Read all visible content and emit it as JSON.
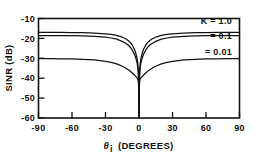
{
  "chart_data": {
    "type": "line",
    "title": "",
    "xlabel": "θᵢ (DEGREES)",
    "ylabel": "SINR (dB)",
    "xlim": [
      -90,
      90
    ],
    "ylim": [
      -60,
      -10
    ],
    "grid": false,
    "legend_position": "inside-right",
    "xticks": [
      -90,
      -60,
      -30,
      0,
      30,
      60,
      90
    ],
    "xticklabels": [
      "-90",
      "-60",
      "-30",
      "0",
      "30",
      "60",
      "90"
    ],
    "yticks": [
      -10,
      -20,
      -30,
      -40,
      -50,
      -60
    ],
    "yticklabels": [
      "-10",
      "-20",
      "-30",
      "-40",
      "-50",
      "-60"
    ],
    "series": [
      {
        "name": "K = 1.0",
        "label": "K = 1.0",
        "plateau_db": -17.0,
        "null_db": -60,
        "x": [
          -90,
          -80,
          -70,
          -60,
          -50,
          -40,
          -30,
          -25,
          -20,
          -15,
          -12,
          -10,
          -8,
          -6,
          -4,
          -3,
          -2,
          -1.2,
          -0.6,
          -0.25,
          0,
          0.25,
          0.6,
          1.2,
          2,
          3,
          4,
          6,
          8,
          10,
          12,
          15,
          20,
          25,
          30,
          40,
          50,
          60,
          70,
          80,
          90
        ],
        "y": [
          -17.0,
          -17.0,
          -17.0,
          -17.05,
          -17.15,
          -17.3,
          -17.7,
          -18.0,
          -18.5,
          -19.4,
          -20.2,
          -20.9,
          -21.9,
          -23.4,
          -25.6,
          -27.2,
          -29.4,
          -32.0,
          -36.0,
          -41.5,
          -60.0,
          -41.5,
          -36.0,
          -32.0,
          -29.4,
          -27.2,
          -25.6,
          -23.4,
          -21.9,
          -20.9,
          -20.2,
          -19.4,
          -18.5,
          -18.0,
          -17.7,
          -17.3,
          -17.15,
          -17.05,
          -17.0,
          -17.0,
          -17.0
        ]
      },
      {
        "name": "= 0.1",
        "label": "= 0.1",
        "plateau_db": -18.6,
        "null_db": -60,
        "x": [
          -90,
          -80,
          -70,
          -60,
          -50,
          -40,
          -30,
          -25,
          -20,
          -15,
          -12,
          -10,
          -8,
          -6,
          -4,
          -3,
          -2,
          -1.2,
          -0.6,
          -0.25,
          0,
          0.25,
          0.6,
          1.2,
          2,
          3,
          4,
          6,
          8,
          10,
          12,
          15,
          20,
          25,
          30,
          40,
          50,
          60,
          70,
          80,
          90
        ],
        "y": [
          -18.6,
          -18.6,
          -18.6,
          -18.65,
          -18.75,
          -18.95,
          -19.4,
          -19.8,
          -20.4,
          -21.5,
          -22.4,
          -23.2,
          -24.3,
          -25.9,
          -28.1,
          -29.6,
          -31.6,
          -34.0,
          -37.6,
          -42.5,
          -60.0,
          -42.5,
          -37.6,
          -34.0,
          -31.6,
          -29.6,
          -28.1,
          -25.9,
          -24.3,
          -23.2,
          -22.4,
          -21.5,
          -20.4,
          -19.8,
          -19.4,
          -18.95,
          -18.75,
          -18.65,
          -18.6,
          -18.6,
          -18.6
        ]
      },
      {
        "name": "= 0.01",
        "label": "= 0.01",
        "plateau_db": -30.2,
        "null_db": -60,
        "x": [
          -90,
          -80,
          -70,
          -60,
          -50,
          -40,
          -30,
          -25,
          -20,
          -15,
          -12,
          -10,
          -8,
          -6,
          -4,
          -3,
          -2,
          -1.2,
          -0.6,
          -0.25,
          0,
          0.25,
          0.6,
          1.2,
          2,
          3,
          4,
          6,
          8,
          10,
          12,
          15,
          20,
          25,
          30,
          40,
          50,
          60,
          70,
          80,
          90
        ],
        "y": [
          -30.2,
          -30.2,
          -30.25,
          -30.3,
          -30.5,
          -30.8,
          -31.5,
          -32.0,
          -32.8,
          -34.0,
          -34.9,
          -35.6,
          -36.4,
          -37.4,
          -38.5,
          -39.0,
          -39.6,
          -40.3,
          -41.6,
          -44.5,
          -60.0,
          -44.5,
          -41.6,
          -40.3,
          -39.6,
          -39.0,
          -38.5,
          -37.4,
          -36.4,
          -35.6,
          -34.9,
          -34.0,
          -32.8,
          -32.0,
          -31.5,
          -30.8,
          -30.5,
          -30.3,
          -30.25,
          -30.2,
          -30.2
        ]
      }
    ],
    "annotations": [
      {
        "text": "K = 1.0",
        "x_px": 189,
        "y_px": 21
      },
      {
        "text": "= 0.1",
        "x_px": 199,
        "y_px": 36
      },
      {
        "text": "= 0.01",
        "x_px": 196,
        "y_px": 52
      }
    ]
  },
  "axes": {
    "x_title": "θ",
    "x_title_sub": "i",
    "x_title_rest": "(DEGREES)",
    "y_title": "SINR (dB)"
  },
  "colors": {
    "ink": "#111111",
    "background": "#ffffff"
  }
}
